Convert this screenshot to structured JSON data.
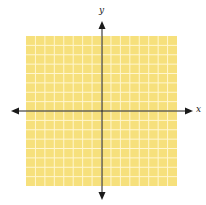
{
  "diagram": {
    "type": "coordinate-plane",
    "x_axis_label": "x",
    "y_axis_label": "y",
    "grid": {
      "cells_x": 16,
      "cells_y": 16,
      "fill": "#f6e07c",
      "line_color": "#fff6cf"
    },
    "axis_color": "#1a1a1a"
  }
}
